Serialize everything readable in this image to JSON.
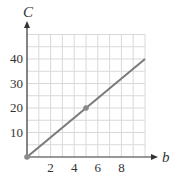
{
  "chart_data": {
    "type": "line",
    "title": "",
    "xlabel": "b",
    "ylabel": "C",
    "xlim": [
      0,
      10
    ],
    "ylim": [
      0,
      50
    ],
    "x_ticks": [
      2,
      4,
      6,
      8
    ],
    "y_ticks": [
      10,
      20,
      30,
      40
    ],
    "x_tick_labels": [
      "2",
      "4",
      "6",
      "8"
    ],
    "y_tick_labels": [
      "10",
      "20",
      "30",
      "40"
    ],
    "grid": true,
    "grid_x_step": 1,
    "grid_y_step": 5,
    "series": [
      {
        "name": "C = 4b",
        "x": [
          0,
          10
        ],
        "y": [
          0,
          40
        ],
        "color": "#7a7a7a"
      }
    ],
    "points": [
      {
        "x": 0,
        "y": 0
      },
      {
        "x": 5,
        "y": 20
      }
    ],
    "colors": {
      "line": "#7a7a7a",
      "grid": "#d9d9d9",
      "axis": "#333333",
      "point": "#8a8a8a"
    }
  }
}
